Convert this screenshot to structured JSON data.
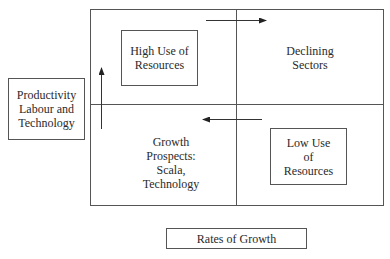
{
  "diagram": {
    "y_axis_label": "Productivity\nLabour and\nTechnology",
    "x_axis_label": "Rates of Growth",
    "quadrants": {
      "top_left": "High Use of\nResources",
      "top_right": "Declining\nSectors",
      "bottom_left": "Growth\nProspects:\nScala,\nTechnology",
      "bottom_right": "Low Use\nof\nResources"
    },
    "arrows": [
      {
        "name": "up-arrow",
        "direction": "up",
        "location": "left edge, bottom-left to top-left quadrant"
      },
      {
        "name": "right-arrow",
        "direction": "right",
        "location": "top, top-left to top-right quadrant"
      },
      {
        "name": "left-arrow",
        "direction": "left",
        "location": "middle, bottom-right to bottom-left quadrant"
      }
    ],
    "colors": {
      "line": "#555555",
      "text": "#2a2a2a",
      "background": "#ffffff"
    }
  }
}
